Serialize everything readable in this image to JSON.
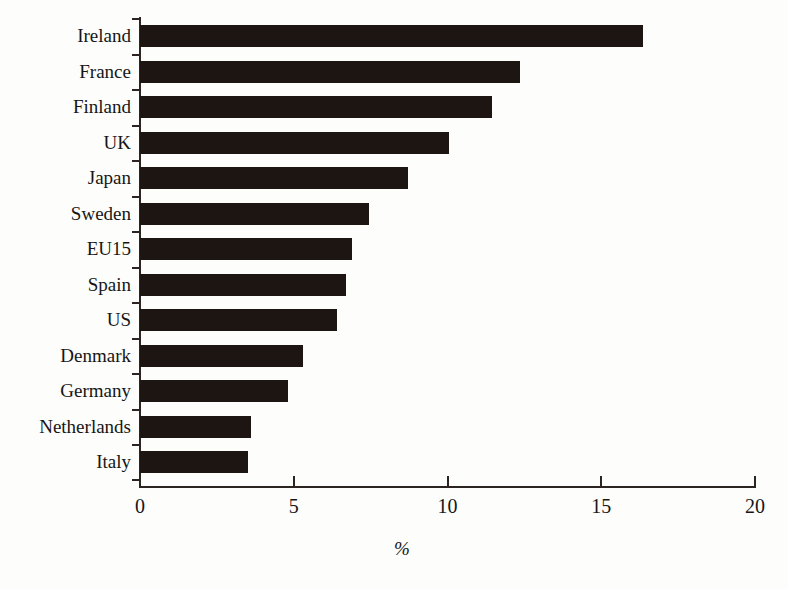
{
  "chart_data": {
    "type": "bar",
    "orientation": "horizontal",
    "title": "",
    "subtitle": "",
    "xlabel": "%",
    "ylabel": "",
    "xlim": [
      0,
      20
    ],
    "xticks": [
      0,
      5,
      10,
      15,
      20
    ],
    "xtick_labels": [
      "0",
      "5",
      "10",
      "15",
      "20"
    ],
    "grid": false,
    "legend": false,
    "categories": [
      "Ireland",
      "France",
      "Finland",
      "UK",
      "Japan",
      "Sweden",
      "EU15",
      "Spain",
      "US",
      "Denmark",
      "Germany",
      "Netherlands",
      "Italy"
    ],
    "values": [
      16.35,
      12.35,
      11.45,
      10.05,
      8.7,
      7.45,
      6.9,
      6.7,
      6.4,
      5.3,
      4.8,
      3.6,
      3.5
    ],
    "series": [
      {
        "name": "",
        "values": [
          16.35,
          12.35,
          11.45,
          10.05,
          8.7,
          7.45,
          6.9,
          6.7,
          6.4,
          5.3,
          4.8,
          3.6,
          3.5
        ]
      }
    ],
    "colors": {
      "bar": "#1c1512",
      "axis": "#2b2420",
      "text": "#161616",
      "background": "#fdfdfb"
    }
  }
}
